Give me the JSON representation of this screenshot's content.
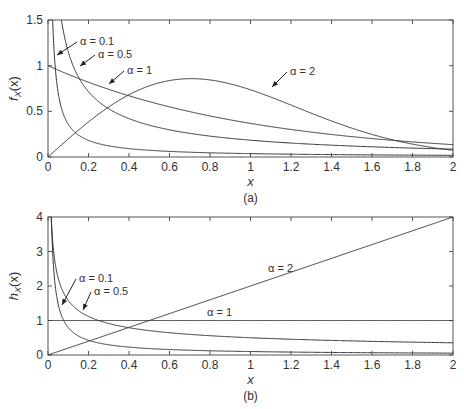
{
  "chart_data": [
    {
      "id": "a",
      "type": "line",
      "caption": "(a)",
      "xlabel": "x",
      "ylabel": "f_X(x)",
      "ylabel_main": "f",
      "ylabel_sub": "X",
      "ylabel_arg": "(x)",
      "xlim": [
        0,
        2
      ],
      "ylim": [
        0,
        1.5
      ],
      "xticks": [
        0,
        0.2,
        0.4,
        0.6,
        0.8,
        1,
        1.2,
        1.4,
        1.6,
        1.8,
        2
      ],
      "xtick_labels": [
        "0",
        "0.2",
        "0.4",
        "0.6",
        "0.8",
        "1",
        "1.2",
        "1.4",
        "1.6",
        "1.8",
        "2"
      ],
      "yticks": [
        0,
        0.5,
        1,
        1.5
      ],
      "ytick_labels": [
        "0",
        "0.5",
        "1",
        "1.5"
      ],
      "grid": false,
      "function": "weibull_pdf",
      "series": [
        {
          "name": "α = 0.1",
          "alpha": 0.1
        },
        {
          "name": "α = 0.5",
          "alpha": 0.5
        },
        {
          "name": "α = 1",
          "alpha": 1
        },
        {
          "name": "α = 2",
          "alpha": 2
        }
      ],
      "annotations": [
        {
          "text": "α = 0.1",
          "series": "α = 0.1",
          "x": 0.1,
          "y": 1.1
        },
        {
          "text": "α = 0.5",
          "series": "α = 0.5",
          "x": 0.18,
          "y": 0.94
        },
        {
          "text": "α = 1",
          "series": "α = 1",
          "x": 0.45,
          "y": 0.83
        },
        {
          "text": "α = 2",
          "series": "α = 2",
          "x": 1.1,
          "y": 0.65
        }
      ]
    },
    {
      "id": "b",
      "type": "line",
      "caption": "(b)",
      "xlabel": "x",
      "ylabel": "h_X(x)",
      "ylabel_main": "h",
      "ylabel_sub": "X",
      "ylabel_arg": "(x)",
      "xlim": [
        0,
        2
      ],
      "ylim": [
        0,
        4
      ],
      "xticks": [
        0,
        0.2,
        0.4,
        0.6,
        0.8,
        1,
        1.2,
        1.4,
        1.6,
        1.8,
        2
      ],
      "xtick_labels": [
        "0",
        "0.2",
        "0.4",
        "0.6",
        "0.8",
        "1",
        "1.2",
        "1.4",
        "1.6",
        "1.8",
        "2"
      ],
      "yticks": [
        0,
        1,
        2,
        3,
        4
      ],
      "ytick_labels": [
        "0",
        "1",
        "2",
        "3",
        "4"
      ],
      "grid": false,
      "function": "weibull_hazard",
      "series": [
        {
          "name": "α = 0.1",
          "alpha": 0.1
        },
        {
          "name": "α = 0.5",
          "alpha": 0.5
        },
        {
          "name": "α = 1",
          "alpha": 1
        },
        {
          "name": "α = 2",
          "alpha": 2
        }
      ],
      "annotations": [
        {
          "text": "α = 0.1",
          "series": "α = 0.1",
          "x": 0.12,
          "y": 2.0
        },
        {
          "text": "α = 0.5",
          "series": "α = 0.5",
          "x": 0.22,
          "y": 1.6
        },
        {
          "text": "α = 1",
          "series": "α = 1",
          "x": 0.85,
          "y": 1.2
        },
        {
          "text": "α = 2",
          "series": "α = 2",
          "x": 1.25,
          "y": 2.45
        }
      ]
    }
  ]
}
